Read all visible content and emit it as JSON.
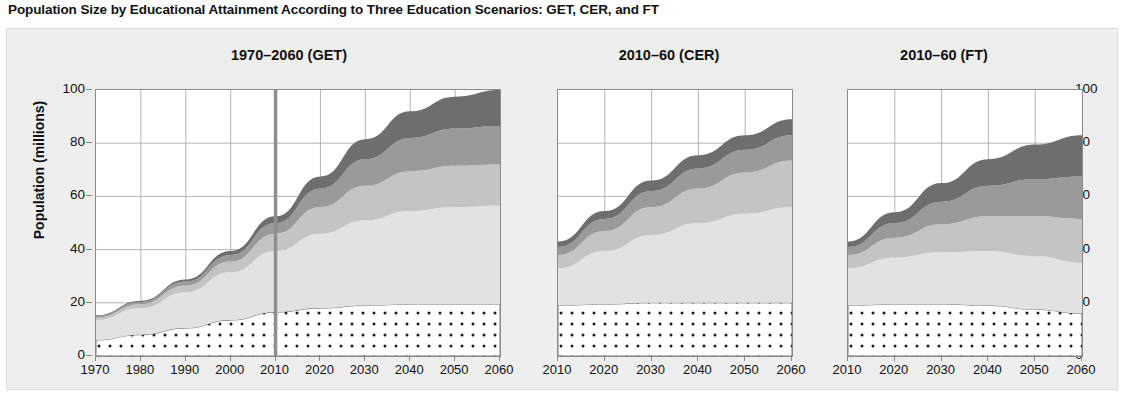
{
  "figure": {
    "title": "Population Size by Educational Attainment According to Three Education Scenarios: GET, CER, and FT",
    "ylabel": "Population (millions)"
  },
  "colors": {
    "background": "#ffffff",
    "card_background": "#eeeeee",
    "axis": "#8a8a8a",
    "gridline": "#b4b4b4",
    "marker_2010": "#8f8f8f",
    "layer_no_education": "#ffffff",
    "layer_primary": "#e2e2e2",
    "layer_secondary": "#c4c4c4",
    "layer_upper_secondary": "#9a9a9a",
    "layer_tertiary": "#6e6e6e",
    "dot_pattern": "#1a1a1a"
  },
  "chart_data": {
    "type": "area",
    "title": "Population Size by Educational Attainment According to Three Education Scenarios: GET, CER, and FT",
    "xlabel": "",
    "ylabel": "Population (millions)",
    "ylim": [
      0,
      100
    ],
    "yticks": [
      0,
      20,
      40,
      60,
      80,
      100
    ],
    "grid": true,
    "stacked": true,
    "legend_position": "none",
    "panels": [
      {
        "title": "1970–2060 (GET)",
        "scenario": "GET",
        "xlim": [
          1970,
          2060
        ],
        "x": [
          1970,
          1980,
          1990,
          2000,
          2010,
          2020,
          2030,
          2040,
          2050,
          2060
        ],
        "xticks": [
          1970,
          1980,
          1990,
          2000,
          2010,
          2020,
          2030,
          2040,
          2050,
          2060
        ],
        "annotation_line_x": 2010,
        "series": [
          {
            "name": "No education",
            "pattern": "dots",
            "values": [
              6.0,
              8.0,
              10.5,
              13.5,
              16.5,
              18.0,
              19.0,
              19.5,
              19.5,
              19.5
            ]
          },
          {
            "name": "Primary",
            "pattern": "solid",
            "values": [
              7.5,
              10.0,
              13.5,
              18.0,
              23.0,
              28.0,
              32.0,
              35.0,
              36.5,
              37.0
            ]
          },
          {
            "name": "Secondary",
            "pattern": "solid",
            "values": [
              1.0,
              1.5,
              2.5,
              4.0,
              6.5,
              10.0,
              13.0,
              15.0,
              15.5,
              15.5
            ]
          },
          {
            "name": "Upper secondary",
            "pattern": "solid",
            "values": [
              0.5,
              0.8,
              1.5,
              2.5,
              4.0,
              7.0,
              10.0,
              12.5,
              14.0,
              14.5
            ]
          },
          {
            "name": "Tertiary",
            "pattern": "solid",
            "values": [
              0.3,
              0.5,
              0.8,
              1.5,
              2.5,
              4.5,
              7.5,
              10.0,
              12.0,
              13.5
            ]
          }
        ],
        "totals": [
          15.3,
          20.8,
          28.8,
          39.5,
          52.5,
          67.5,
          81.5,
          92.0,
          97.5,
          100.0
        ]
      },
      {
        "title": "2010–60 (CER)",
        "scenario": "CER",
        "xlim": [
          2010,
          2060
        ],
        "x": [
          2010,
          2020,
          2030,
          2040,
          2050,
          2060
        ],
        "xticks": [
          2010,
          2020,
          2030,
          2040,
          2050,
          2060
        ],
        "series": [
          {
            "name": "No education",
            "pattern": "dots",
            "values": [
              19.0,
              19.5,
              20.0,
              20.0,
              20.0,
              20.0
            ]
          },
          {
            "name": "Primary",
            "pattern": "solid",
            "values": [
              14.0,
              20.0,
              25.5,
              30.0,
              33.5,
              36.0
            ]
          },
          {
            "name": "Secondary",
            "pattern": "solid",
            "values": [
              5.0,
              7.5,
              10.5,
              13.0,
              15.5,
              17.5
            ]
          },
          {
            "name": "Upper secondary",
            "pattern": "solid",
            "values": [
              3.0,
              4.5,
              6.0,
              7.5,
              8.5,
              9.5
            ]
          },
          {
            "name": "Tertiary",
            "pattern": "solid",
            "values": [
              2.0,
              3.0,
              4.0,
              5.0,
              5.5,
              6.0
            ]
          }
        ],
        "totals": [
          43.0,
          54.5,
          66.0,
          75.5,
          83.0,
          89.0
        ]
      },
      {
        "title": "2010–60 (FT)",
        "scenario": "FT",
        "xlim": [
          2010,
          2060
        ],
        "x": [
          2010,
          2020,
          2030,
          2040,
          2050,
          2060
        ],
        "xticks": [
          2010,
          2020,
          2030,
          2040,
          2050,
          2060
        ],
        "series": [
          {
            "name": "No education",
            "pattern": "dots",
            "values": [
              19.0,
              19.5,
              19.5,
              19.0,
              17.5,
              16.0
            ]
          },
          {
            "name": "Primary",
            "pattern": "solid",
            "values": [
              14.0,
              17.5,
              19.5,
              20.5,
              20.0,
              19.0
            ]
          },
          {
            "name": "Secondary",
            "pattern": "solid",
            "values": [
              5.0,
              7.5,
              10.5,
              13.0,
              15.0,
              16.5
            ]
          },
          {
            "name": "Upper secondary",
            "pattern": "solid",
            "values": [
              3.0,
              5.5,
              8.5,
              11.5,
              14.0,
              16.0
            ]
          },
          {
            "name": "Tertiary",
            "pattern": "solid",
            "values": [
              2.0,
              4.0,
              7.0,
              10.0,
              13.0,
              15.5
            ]
          }
        ],
        "totals": [
          43.0,
          54.0,
          65.0,
          74.0,
          79.5,
          83.0
        ]
      }
    ]
  }
}
